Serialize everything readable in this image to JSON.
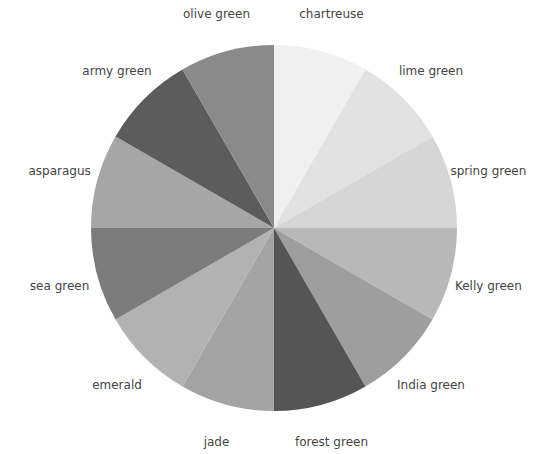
{
  "chart_data": {
    "type": "pie",
    "title": "",
    "start_angle_deg": 0,
    "direction": "clockwise",
    "center": [
      274,
      228
    ],
    "radius": 183,
    "label_radius": 222,
    "legend": "none (labels placed outside slices)",
    "categories": [
      "chartreuse",
      "lime green",
      "spring green",
      "Kelly green",
      "India green",
      "forest green",
      "jade",
      "emerald",
      "sea green",
      "asparagus",
      "army green",
      "olive green"
    ],
    "values": [
      1,
      1,
      1,
      1,
      1,
      1,
      1,
      1,
      1,
      1,
      1,
      1
    ],
    "colors": [
      "#f0f0f0",
      "#e2e2e2",
      "#d6d6d6",
      "#b8b8b8",
      "#9e9e9e",
      "#555555",
      "#a4a4a4",
      "#b2b2b2",
      "#7c7c7c",
      "#a6a6a6",
      "#5c5c5c",
      "#8a8a8a"
    ]
  }
}
